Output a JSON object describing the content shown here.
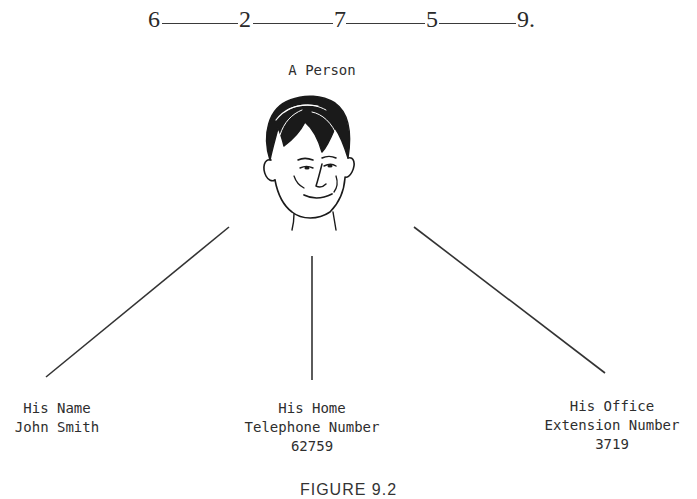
{
  "sequence": {
    "digits": [
      "6",
      "2",
      "7",
      "5",
      "9"
    ],
    "terminator": "."
  },
  "person": {
    "title": "A Person",
    "icon": "face-sketch-icon"
  },
  "branches": [
    {
      "line1": "His Name",
      "line2": "John Smith",
      "line3": ""
    },
    {
      "line1": "His Home",
      "line2": "Telephone Number",
      "line3": "62759"
    },
    {
      "line1": "His Office",
      "line2": "Extension Number",
      "line3": "3719"
    }
  ],
  "caption": "FIGURE 9.2"
}
